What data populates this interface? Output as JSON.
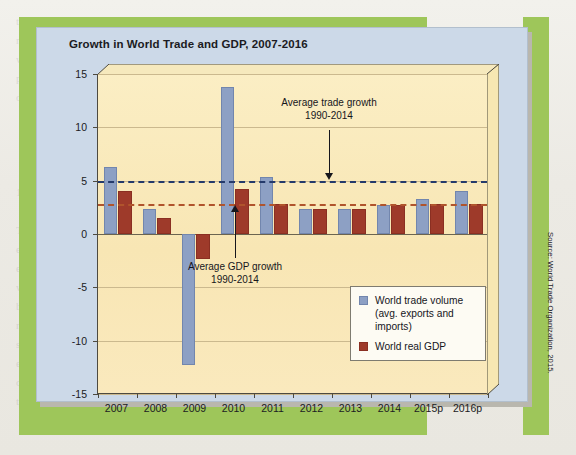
{
  "page": {
    "ghost_text": "the  following  paragraphs  we  review\nmerchandise  and  services  trade  in  the\nworld  economy  and  consider  how  the\npattern  of  world  trade  has  changed\nover  recent  decades.\n\n\n\n\n1-2    Building  the  Global  Economy\n\nThe  depreciation  of  a  currency  makes\nexports  cheaper  and  imports  more\nexpensive  for  domestic  consumers,\nwhich  tends  to  improve  the  trade\nbalance  over  time.  However,  the\nresponse  of  trade  volumes  may  be\nslow,  giving  rise  to  the  J-curve\neffect  documented  in  many  studies\nof  exchange  rate  adjustment  and\nthe  current  account  balance."
  },
  "chart_panel": {
    "title": "Growth in World Trade and GDP, 2007-2016",
    "source_note": "Source: World Trade Organization, 2015."
  },
  "legend": {
    "items": [
      {
        "label": "World trade volume (avg. exports and imports)",
        "color": "#8da0c4",
        "name": "world-trade-volume"
      },
      {
        "label": "World real GDP",
        "color": "#9e3a2a",
        "name": "world-real-gdp"
      }
    ]
  },
  "annotations": {
    "trade": {
      "line1": "Average trade growth",
      "line2": "1990-2014"
    },
    "gdp": {
      "line1": "Average GDP growth",
      "line2": "1990-2014"
    }
  },
  "chart_data": {
    "type": "bar",
    "title": "Growth in World Trade and GDP, 2007-2016",
    "xlabel": "",
    "ylabel": "",
    "ylim": [
      -15,
      15
    ],
    "yticks": [
      15,
      10,
      5,
      0,
      -5,
      -10,
      -15
    ],
    "ytick_labels": [
      "15",
      "10",
      "5",
      "0",
      "-5",
      "-10",
      "-15"
    ],
    "grid": true,
    "legend_position": "inside-right",
    "categories": [
      "2007",
      "2008",
      "2009",
      "2010",
      "2011",
      "2012",
      "2013",
      "2014",
      "2015p",
      "2016p"
    ],
    "series": [
      {
        "name": "World trade volume (avg. exports and imports)",
        "color": "#8da0c4",
        "values": [
          6.3,
          2.3,
          -12.3,
          13.8,
          5.3,
          2.3,
          2.3,
          2.7,
          3.3,
          4.0
        ]
      },
      {
        "name": "World real GDP",
        "color": "#9e3a2a",
        "values": [
          4.0,
          1.5,
          -2.3,
          4.2,
          2.8,
          2.3,
          2.3,
          2.7,
          2.8,
          2.8
        ]
      }
    ],
    "reference_lines": [
      {
        "name": "average-trade-growth",
        "value": 5.0,
        "color": "#243a6b",
        "style": "dashed",
        "label": "Average trade growth 1990-2014"
      },
      {
        "name": "average-gdp-growth",
        "value": 2.8,
        "color": "#b0542c",
        "style": "dashed",
        "label": "Average GDP growth 1990-2014"
      }
    ]
  }
}
